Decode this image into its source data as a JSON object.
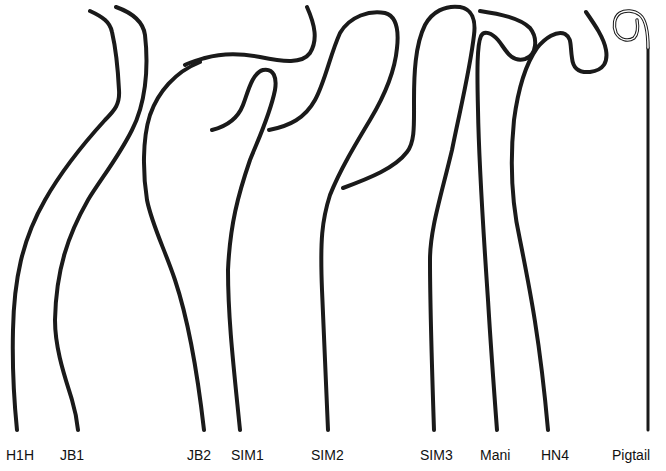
{
  "figure": {
    "title": "",
    "background": "#ffffff",
    "stroke_color": "#1a1a1a",
    "catheters": [
      {
        "id": "h1h",
        "label": "H1H",
        "label_x": 6
      },
      {
        "id": "jb1",
        "label": "JB1",
        "label_x": 60
      },
      {
        "id": "jb2",
        "label": "JB2",
        "label_x": 187
      },
      {
        "id": "sim1",
        "label": "SIM1",
        "label_x": 231
      },
      {
        "id": "sim2",
        "label": "SIM2",
        "label_x": 311
      },
      {
        "id": "sim3",
        "label": "SIM3",
        "label_x": 420
      },
      {
        "id": "mani",
        "label": "Mani",
        "label_x": 480
      },
      {
        "id": "hn4",
        "label": "HN4",
        "label_x": 541
      },
      {
        "id": "pigtail",
        "label": "Pigtail",
        "label_x": 612
      }
    ]
  }
}
